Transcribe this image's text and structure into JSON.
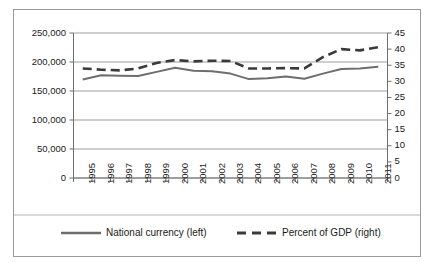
{
  "chart_data": {
    "type": "line",
    "title": "",
    "subtitle": "",
    "xlabel": "",
    "ylabel": "",
    "grid": true,
    "legend_position": "bottom",
    "categories": [
      "1995",
      "1996",
      "1997",
      "1998",
      "1999",
      "2000",
      "2001",
      "2002",
      "2003",
      "2004",
      "2005",
      "2006",
      "2007",
      "2008",
      "2009",
      "2010",
      "2011"
    ],
    "axes": {
      "left": {
        "label": "",
        "ylim": [
          0,
          250000
        ],
        "ticks": [
          0,
          50000,
          100000,
          150000,
          200000,
          250000
        ],
        "tick_labels": [
          "0",
          "50,000",
          "100,000",
          "150,000",
          "200,000",
          "250,000"
        ]
      },
      "right": {
        "label": "",
        "ylim": [
          0,
          45
        ],
        "ticks": [
          0,
          5,
          10,
          15,
          20,
          25,
          30,
          35,
          40,
          45
        ],
        "tick_labels": [
          "0",
          "5",
          "10",
          "15",
          "20",
          "25",
          "30",
          "35",
          "40",
          "45"
        ]
      }
    },
    "series": [
      {
        "name": "National currency (left)",
        "axis": "left",
        "style": "solid",
        "color": "#6e6e6e",
        "values": [
          170000,
          177000,
          176500,
          176000,
          183000,
          190000,
          185000,
          184000,
          180000,
          170500,
          172000,
          175000,
          171000,
          180000,
          188000,
          189000,
          192000
        ]
      },
      {
        "name": "Percent of GDP (right)",
        "axis": "right",
        "style": "dashed",
        "color": "#3a3a3a",
        "values": [
          34.0,
          33.6,
          33.4,
          34.0,
          35.7,
          36.6,
          36.2,
          36.4,
          36.3,
          34.0,
          34.0,
          34.1,
          34.0,
          37.5,
          40.0,
          39.6,
          40.6
        ]
      }
    ]
  },
  "legend": {
    "items": [
      {
        "label": "National currency (left)",
        "style": "solid",
        "color": "#6e6e6e"
      },
      {
        "label": "Percent of GDP (right)",
        "style": "dashed",
        "color": "#3a3a3a"
      }
    ]
  }
}
